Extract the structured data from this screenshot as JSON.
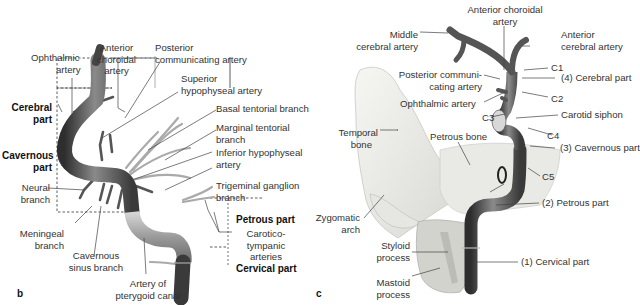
{
  "figure": {
    "panels": [
      {
        "letter": "b",
        "section_labels": {
          "cerebral": "Cerebral part",
          "cavernous": "Cavernous part",
          "petrous": "Petrous part",
          "cervical": "Cervical part"
        },
        "labels": {
          "ophthalmic": "Ophthalmic artery",
          "anterior_choroidal": "Anterior choroidal artery",
          "posterior_communicating": "Posterior communicating artery",
          "superior_hypophyseal": "Superior hypophyseal artery",
          "basal_tentorial": "Basal tentorial branch",
          "marginal_tentorial": "Marginal tentorial branch",
          "inferior_hypophyseal": "Inferior hypophyseal artery",
          "trigeminal_ganglion": "Trigeminal ganglion branch",
          "neural": "Neural branch",
          "meningeal": "Meningeal branch",
          "cavernous_sinus": "Cavernous sinus branch",
          "pterygoid_canal": "Artery of pterygoid canal",
          "caroticotympanic": "Carotico-tympanic arteries"
        }
      },
      {
        "letter": "c",
        "labels": {
          "anterior_choroidal": "Anterior choroidal artery",
          "middle_cerebral": "Middle cerebral artery",
          "anterior_cerebral": "Anterior cerebral artery",
          "c1": "C1",
          "cerebral_part": "(4) Cerebral part",
          "posterior_communicating": "Posterior communicating artery",
          "c2": "C2",
          "ophthalmic": "Ophthalmic artery",
          "c3": "C3",
          "carotid_siphon": "Carotid siphon",
          "c4": "C4",
          "temporal_bone": "Temporal bone",
          "petrous_bone": "Petrous bone",
          "cavernous_part": "(3) Cavernous part",
          "c5": "C5",
          "petrous_part": "(2) Petrous part",
          "zygomatic_arch": "Zygomatic arch",
          "styloid_process": "Styloid process",
          "mastoid_process": "Mastoid process",
          "cervical_part": "(1) Cervical part"
        }
      }
    ]
  },
  "text": {
    "b_ophthalmic_1": "Ophthalmic",
    "b_ophthalmic_2": "artery",
    "b_antchor_1": "Anterior",
    "b_antchor_2": "choroidal",
    "b_antchor_3": "artery",
    "b_postcomm_1": "Posterior",
    "b_postcomm_2": "communicating artery",
    "b_suphyp_1": "Superior",
    "b_suphyp_2": "hypophyseal artery",
    "b_basal": "Basal tentorial branch",
    "b_marg_1": "Marginal tentorial",
    "b_marg_2": "branch",
    "b_infhyp_1": "Inferior hypophyseal",
    "b_infhyp_2": "artery",
    "b_trig_1": "Trigeminal ganglion",
    "b_trig_2": "branch",
    "b_cereb_1": "Cerebral",
    "b_cereb_2": "part",
    "b_cav_1": "Cavernous",
    "b_cav_2": "part",
    "b_neural_1": "Neural",
    "b_neural_2": "branch",
    "b_men_1": "Meningeal",
    "b_men_2": "branch",
    "b_cavsin_1": "Cavernous",
    "b_cavsin_2": "sinus branch",
    "b_ptery_1": "Artery of",
    "b_ptery_2": "pterygoid canal",
    "b_petrous": "Petrous part",
    "b_ctymp_1": "Carotico-",
    "b_ctymp_2": "tympanic",
    "b_ctymp_3": "arteries",
    "b_cervical": "Cervical part",
    "c_antchor_1": "Anterior choroidal",
    "c_antchor_2": "artery",
    "c_mca_1": "Middle",
    "c_mca_2": "cerebral artery",
    "c_aca_1": "Anterior",
    "c_aca_2": "cerebral artery",
    "c_c1": "C1",
    "c_cerebral": "(4) Cerebral part",
    "c_pcomm_1": "Posterior communi-",
    "c_pcomm_2": "cating artery",
    "c_c2": "C2",
    "c_ophth": "Ophthalmic artery",
    "c_c3": "C3",
    "c_siphon": "Carotid siphon",
    "c_c4": "C4",
    "c_temp_1": "Temporal",
    "c_temp_2": "bone",
    "c_petbone": "Petrous bone",
    "c_cav": "(3) Cavernous part",
    "c_c5": "C5",
    "c_petrous": "(2) Petrous part",
    "c_zyg_1": "Zygomatic",
    "c_zyg_2": "arch",
    "c_sty_1": "Styloid",
    "c_sty_2": "process",
    "c_mast_1": "Mastoid",
    "c_mast_2": "process",
    "c_cervical": "(1) Cervical part",
    "letter_b": "b",
    "letter_c": "c"
  },
  "colors": {
    "artery_dark": "#3a3a3a",
    "artery_mid": "#777777",
    "artery_light": "#b5b5b5",
    "bone": "#e8e8e4",
    "leader": "#444444"
  }
}
